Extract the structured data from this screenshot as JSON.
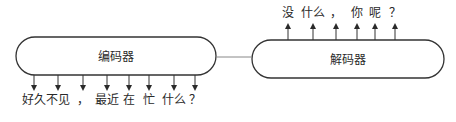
{
  "diagram": {
    "type": "encoder-decoder",
    "encoder": {
      "label": "编码器"
    },
    "decoder": {
      "label": "解码器"
    },
    "input_tokens": [
      {
        "text": "好久",
        "x": 34
      },
      {
        "text": "不见",
        "x": 58
      },
      {
        "text": "，",
        "x": 83
      },
      {
        "text": "最近",
        "x": 107
      },
      {
        "text": "在",
        "x": 129
      },
      {
        "text": "忙",
        "x": 149
      },
      {
        "text": "什么",
        "x": 174
      },
      {
        "text": "？",
        "x": 195
      }
    ],
    "output_tokens": [
      {
        "text": "没",
        "x": 288
      },
      {
        "text": "什么",
        "x": 313
      },
      {
        "text": "，",
        "x": 336
      },
      {
        "text": "你",
        "x": 357
      },
      {
        "text": "呢",
        "x": 375
      },
      {
        "text": "？",
        "x": 395
      }
    ]
  }
}
